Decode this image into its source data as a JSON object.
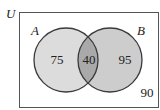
{
  "diagram": {
    "type": "venn",
    "universe_label": "U",
    "sets": [
      {
        "name": "A",
        "only_count": "75",
        "fill": "#dcdcdc"
      },
      {
        "name": "B",
        "only_count": "95",
        "fill": "#cdcdcd"
      }
    ],
    "intersection_count": "40",
    "intersection_fill": "#a9a9a9",
    "outside_count": "90",
    "stroke_color": "#3a3a3a",
    "background": "#ffffff"
  }
}
